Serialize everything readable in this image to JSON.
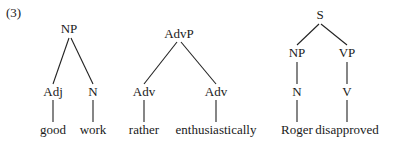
{
  "example_number": "(3)",
  "trees": [
    {
      "root": "NP",
      "children": [
        {
          "label": "Adj",
          "word": "good"
        },
        {
          "label": "N",
          "word": "work"
        }
      ]
    },
    {
      "root": "AdvP",
      "children": [
        {
          "label": "Adv",
          "word": "rather"
        },
        {
          "label": "Adv",
          "word": "enthusiastically"
        }
      ]
    },
    {
      "root": "S",
      "children": [
        {
          "label": "NP",
          "sub": "N",
          "word": "Roger"
        },
        {
          "label": "VP",
          "sub": "V",
          "word": "disapproved"
        }
      ]
    }
  ]
}
